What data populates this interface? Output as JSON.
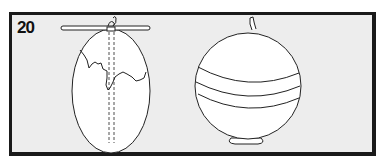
{
  "panel": {
    "step_number": "20",
    "left_figure": "cut-melon-with-string-and-stick",
    "right_figure": "round-melon-with-bands-on-stand"
  },
  "colors": {
    "frame": "#1a1a1a",
    "background": "#ededed",
    "fruit": "#ffffff",
    "line": "#222222"
  }
}
